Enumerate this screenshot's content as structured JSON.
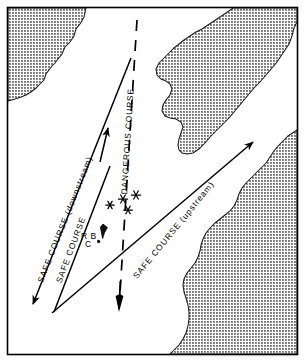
{
  "figure": {
    "kind": "nautical-navigation-chart",
    "frame_border_color": "#000000",
    "water_color": "#ffffff",
    "land_fill_color": "#b4b4b4",
    "land_outline_color": "#1a1a1a",
    "line_color": "#000000"
  },
  "labels": {
    "safe_course_downstream": "SAFE COURSE (downstream)",
    "safe_course_middle": "SAFE COURSE",
    "dangerous_course": "DANGEROUS COURSE",
    "safe_course_upstream": "SAFE COURSE (upstream)"
  },
  "buoy": {
    "line1": "R B",
    "line2": "C",
    "symbol": "buoy-symbol"
  },
  "features": {
    "rock_symbol_count": 4,
    "rock_symbol": "asterisk-rock",
    "land_mass_count": 3,
    "land_masses": [
      "northwest-shore",
      "northeast-shore",
      "southeast-shore"
    ]
  },
  "routes": [
    {
      "name": "safe-course-downstream",
      "style": "solid",
      "direction": "downstream",
      "arrow": "down-left"
    },
    {
      "name": "safe-course-middle",
      "style": "solid",
      "direction": "upstream",
      "arrow": "up"
    },
    {
      "name": "dangerous-course",
      "style": "dashed",
      "direction": "downstream",
      "arrow": "down"
    },
    {
      "name": "safe-course-upstream",
      "style": "solid",
      "direction": "upstream",
      "arrow": "up-right"
    }
  ]
}
